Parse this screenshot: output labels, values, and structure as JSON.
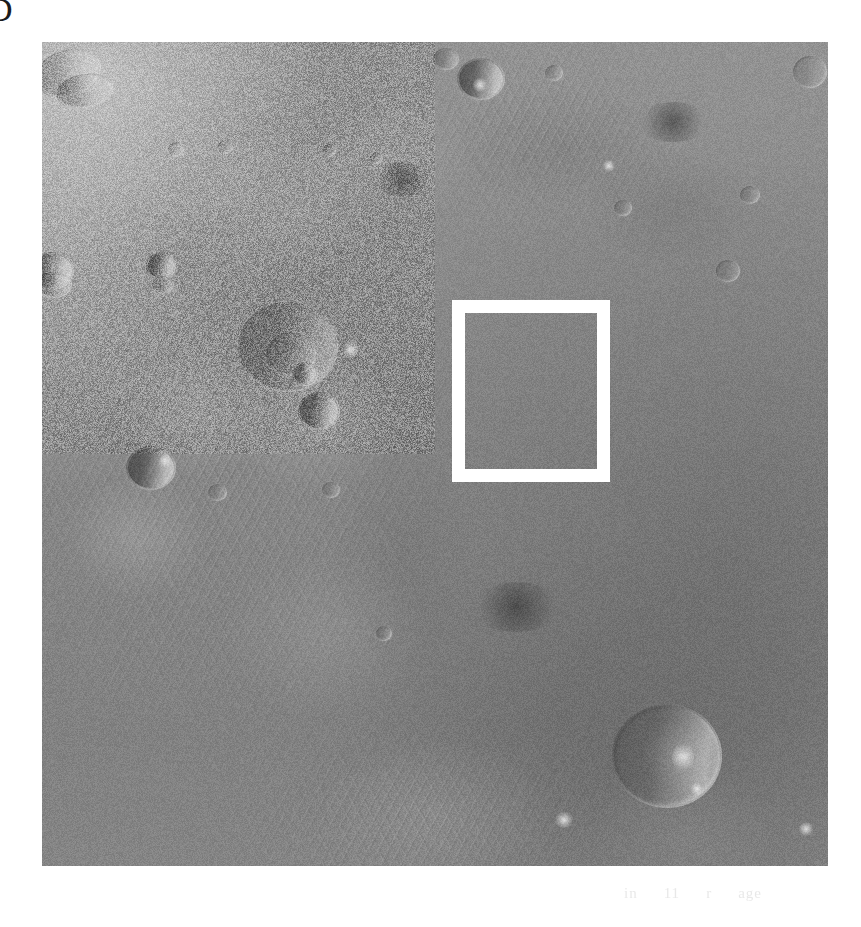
{
  "page": {
    "background_color": "#ffffff",
    "width": 861,
    "height": 927,
    "corner_glyph": "D"
  },
  "plate": {
    "name": "planetary-surface-photograph",
    "subject": "cratered planetary surface terrain",
    "palette": {
      "base_gray": "#8d8d8d",
      "highlight": "#e8e8e8",
      "shadow": "#3a3a3a",
      "marker": "#ffffff"
    },
    "frame": {
      "left": 42,
      "top": 42,
      "width": 786,
      "height": 824
    }
  },
  "inset_marker": {
    "name": "inset-location-box",
    "color": "#ffffff",
    "border_width_px": 13,
    "left": 452,
    "top": 300,
    "width": 158,
    "height": 182
  },
  "ghost_caption": {
    "fragment_1": "in",
    "fragment_2": "11",
    "fragment_3": "r",
    "fragment_4": "age"
  }
}
